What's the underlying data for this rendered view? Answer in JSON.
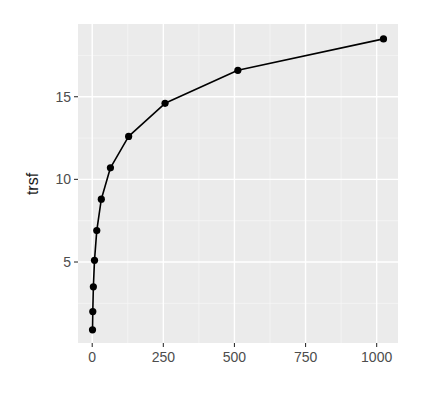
{
  "chart_data": {
    "type": "line",
    "title": "",
    "xlabel": "",
    "ylabel": "trsf",
    "x": [
      1,
      2,
      4,
      8,
      16,
      32,
      64,
      128,
      256,
      512,
      1024
    ],
    "series": [
      {
        "name": "trsf",
        "values": [
          0.9,
          2.0,
          3.5,
          5.1,
          6.9,
          8.8,
          10.7,
          12.6,
          14.6,
          16.6,
          18.5
        ]
      }
    ],
    "xlim": [
      -50,
      1075
    ],
    "ylim": [
      0.1,
      19.4
    ],
    "x_ticks": [
      0,
      250,
      500,
      750,
      1000
    ],
    "x_tick_labels": [
      "0",
      "250",
      "500",
      "750",
      "1000"
    ],
    "y_ticks": [
      5,
      10,
      15
    ],
    "y_tick_labels": [
      "5",
      "10",
      "15"
    ],
    "grid": true,
    "legend": "none",
    "markers": true
  },
  "colors": {
    "panel_background": "#ebebeb",
    "grid_major": "#ffffff",
    "grid_minor": "#f5f5f5",
    "line": "#000000",
    "points": "#000000",
    "tick_text": "#4d4d4d",
    "axis_title": "#1a1a1a"
  }
}
